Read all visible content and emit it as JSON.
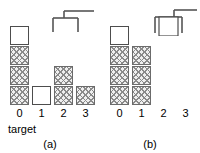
{
  "figure": {
    "type": "blocks-world-gripper-diagram",
    "panels": [
      {
        "id": "a",
        "caption": "(a)",
        "target_label": "target",
        "gripper": {
          "icon": "gripper-open-icon",
          "state": "empty",
          "held_block": null
        },
        "axis_ticks": [
          "0",
          "1",
          "2",
          "3"
        ],
        "columns": [
          {
            "index": "0",
            "height": 4,
            "blocks": [
              "hatched",
              "hatched",
              "hatched",
              "white"
            ]
          },
          {
            "index": "1",
            "height": 1,
            "blocks": [
              "white"
            ]
          },
          {
            "index": "2",
            "height": 2,
            "blocks": [
              "hatched",
              "hatched"
            ]
          },
          {
            "index": "3",
            "height": 1,
            "blocks": [
              "hatched"
            ]
          }
        ]
      },
      {
        "id": "b",
        "caption": "(b)",
        "target_label": "",
        "gripper": {
          "icon": "gripper-holding-icon",
          "state": "holding",
          "held_block": "white"
        },
        "axis_ticks": [
          "0",
          "1",
          "2",
          "3"
        ],
        "columns": [
          {
            "index": "0",
            "height": 4,
            "blocks": [
              "hatched",
              "hatched",
              "hatched",
              "white"
            ]
          },
          {
            "index": "1",
            "height": 3,
            "blocks": [
              "hatched",
              "hatched",
              "hatched"
            ]
          },
          {
            "index": "2",
            "height": 0,
            "blocks": []
          },
          {
            "index": "3",
            "height": 0,
            "blocks": []
          }
        ]
      }
    ],
    "colors": {
      "block_outline": "#4d4d4d",
      "hatch_line": "#8a8a8a",
      "hatch_fill": "#efefef",
      "white_fill": "#ffffff",
      "gripper_stroke": "#555555",
      "text": "#000000",
      "background": "#ffffff"
    }
  }
}
